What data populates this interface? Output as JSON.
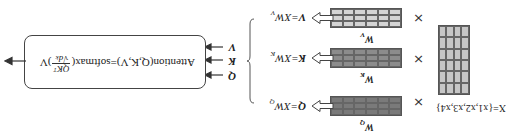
{
  "diagram": {
    "orientation": "rotated-180",
    "input": {
      "label": "X={x1,x2,x3,x4}",
      "matrix": {
        "rows": 6,
        "cols": 4,
        "color": "#c6c6c6"
      }
    },
    "times_symbol": "×",
    "projections": [
      {
        "id": "q",
        "weight_label": "W",
        "weight_sub": "Q",
        "equation_lhs": "Q",
        "equation_rhs": "XW",
        "equation_sub": "Q",
        "matrix": {
          "rows": 3,
          "cols": 6,
          "color": "#7a7a7a"
        }
      },
      {
        "id": "k",
        "weight_label": "W",
        "weight_sub": "K",
        "equation_lhs": "K",
        "equation_rhs": "XW",
        "equation_sub": "K",
        "matrix": {
          "rows": 3,
          "cols": 6,
          "color": "#8c8c8c"
        }
      },
      {
        "id": "v",
        "weight_label": "W",
        "weight_sub": "V",
        "equation_lhs": "V",
        "equation_rhs": "XW",
        "equation_sub": "V",
        "matrix": {
          "rows": 3,
          "cols": 6,
          "color": "#d4d4d4"
        }
      }
    ],
    "attention_inputs": [
      "Q",
      "K",
      "V"
    ],
    "attention_formula": {
      "prefix": "Attention(Q,K,V)=softmax(",
      "numerator": "QKᵀ",
      "denominator": "√dₖ",
      "suffix": ")V"
    }
  }
}
